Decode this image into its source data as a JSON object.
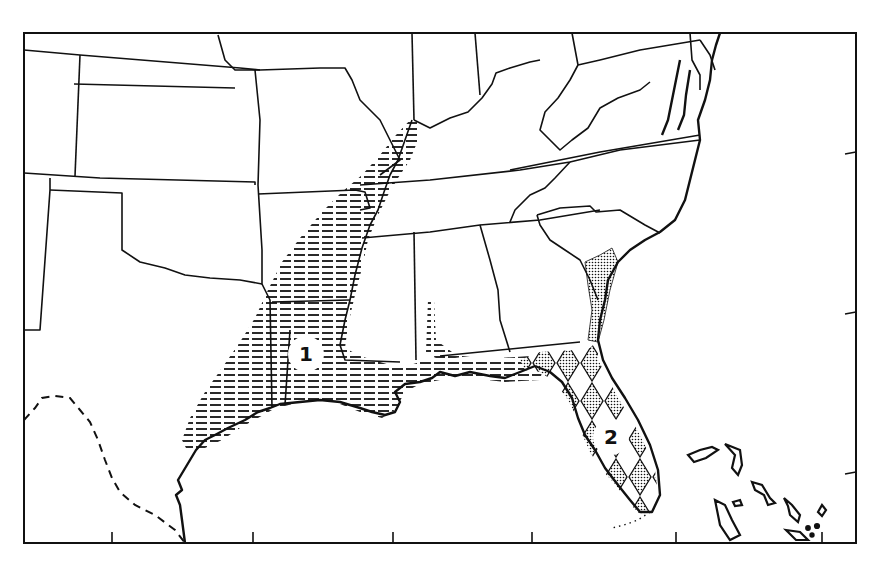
{
  "map": {
    "title": "",
    "region": "Southeastern United States",
    "frame": {
      "left": 24,
      "top": 33,
      "right": 856,
      "bottom": 543
    },
    "colors": {
      "ink": "#111111",
      "paper": "#ffffff"
    },
    "bottom_ticks_x": [
      112,
      253,
      393,
      532,
      676,
      822
    ],
    "right_ticks_y": [
      152,
      312,
      472
    ],
    "zones": [
      {
        "id": "1",
        "label": "1",
        "pattern": "horizontal-hatch",
        "description": "Mississippi valley / western Gulf coast range",
        "label_x": 306,
        "label_y": 354
      },
      {
        "id": "2",
        "label": "2",
        "pattern": "stippled-diamonds",
        "description": "Florida peninsula / southeast Atlantic coast range",
        "label_x": 611,
        "label_y": 437
      }
    ],
    "boundary_styles": {
      "state_lines": "solid",
      "mexico_border": "dashed",
      "florida_keys": "dotted"
    }
  }
}
